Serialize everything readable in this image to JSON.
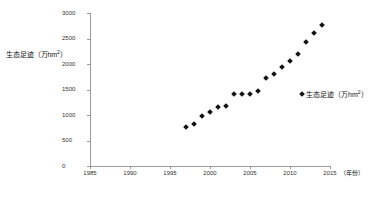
{
  "chart_data": {
    "type": "scatter",
    "title": "",
    "xlabel": "年份",
    "ylabel": "生态足迹（万hm2）",
    "xlim": [
      1985,
      2015
    ],
    "ylim": [
      0,
      3000
    ],
    "grid": false,
    "legend_position": "right",
    "series": [
      {
        "name": "生态足迹（万hm2）",
        "marker": "diamond",
        "color": "#111111",
        "x": [
          1997,
          1998,
          1999,
          2000,
          2001,
          2002,
          2003,
          2004,
          2005,
          2006,
          2007,
          2008,
          2009,
          2010,
          2011,
          2012,
          2013,
          2014
        ],
        "values": [
          760,
          830,
          980,
          1060,
          1150,
          1175,
          1420,
          1420,
          1420,
          1480,
          1730,
          1810,
          1950,
          2050,
          2200,
          2440,
          2600,
          2760
        ]
      }
    ],
    "x_ticks": [
      1985,
      1990,
      1995,
      2000,
      2005,
      2010,
      2015
    ],
    "y_ticks": [
      0,
      500,
      1000,
      1500,
      2000,
      2500,
      3000
    ],
    "x_tick_labels": [
      "1985",
      "1990",
      "1995",
      "2000",
      "2005",
      "2010",
      "2015"
    ],
    "y_tick_labels": [
      "0",
      "500",
      "1000",
      "1500",
      "2000",
      "2500",
      "3000"
    ],
    "x_axis_unit_note": "（年份）"
  },
  "axis": {
    "y_title_main": "生态足迹（万hm",
    "y_title_sup": "2",
    "y_title_tail": "）"
  },
  "legend": {
    "entries": [
      {
        "label_main": "生态足迹（万hm",
        "label_sup": "2",
        "label_tail": "）"
      }
    ]
  }
}
